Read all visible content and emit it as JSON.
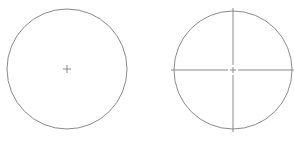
{
  "diagram": {
    "type": "circle-centerline-comparison",
    "stroke_color": "#8a8a8a",
    "background": "#ffffff",
    "figures": [
      {
        "id": "circle-with-center-mark",
        "cx": 67,
        "cy": 69,
        "r": 60,
        "center_mark_size": 4,
        "centerlines": false
      },
      {
        "id": "circle-with-centerlines",
        "cx": 233,
        "cy": 70,
        "r": 59,
        "center_mark_size": 3,
        "centerlines": true,
        "centerline_overshoot": 3,
        "centerline_gap": 4
      }
    ]
  }
}
